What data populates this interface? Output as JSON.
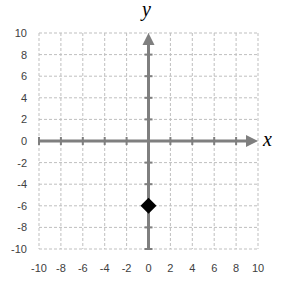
{
  "chart_data": {
    "type": "scatter",
    "title": "",
    "xlabel": "x",
    "ylabel": "y",
    "xlim": [
      -10,
      10
    ],
    "ylim": [
      -10,
      10
    ],
    "x_ticks": [
      -10,
      -8,
      -6,
      -4,
      -2,
      0,
      2,
      4,
      6,
      8,
      10
    ],
    "y_ticks": [
      -10,
      -8,
      -6,
      -4,
      -2,
      0,
      2,
      4,
      6,
      8,
      10
    ],
    "grid": true,
    "legend": null,
    "series": [
      {
        "name": "point",
        "marker": "diamond",
        "color": "#000000",
        "points": [
          {
            "x": 0,
            "y": -6
          }
        ]
      }
    ]
  },
  "style": {
    "axis_color": "#7f7f7f",
    "grid_color": "#bfbfbf",
    "marker_color": "#000000"
  }
}
